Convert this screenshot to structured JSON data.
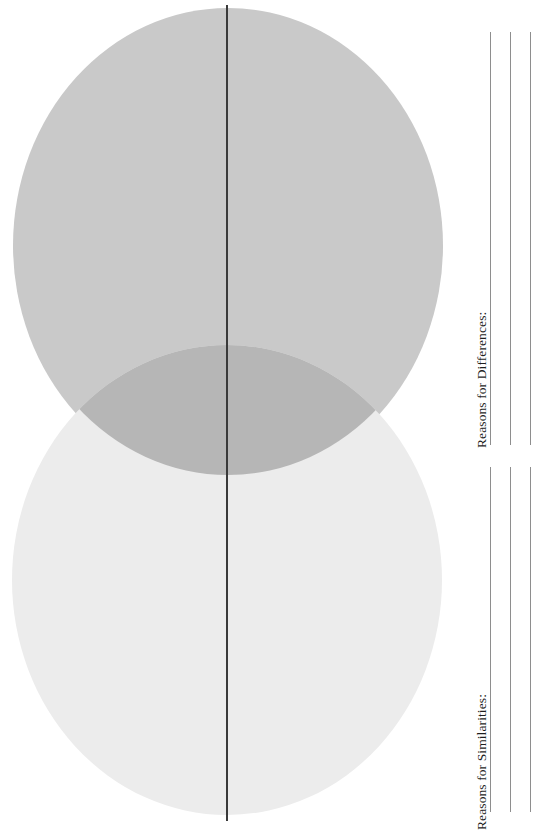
{
  "worksheet": {
    "title": "Venn Diagram Comparison Worksheet",
    "orientation": "landscape-rotated",
    "background_color": "#ffffff"
  },
  "venn": {
    "name": "two-circle-venn-diagram",
    "divider": {
      "name": "center-divider-line",
      "color": "#3a3a3a",
      "orientation": "vertical"
    },
    "circles": [
      {
        "id": "circle-top",
        "label": "",
        "fill_color": "#c9c9c9",
        "position": "upper"
      },
      {
        "id": "circle-bottom",
        "label": "",
        "fill_color": "#ececec",
        "position": "lower"
      }
    ],
    "overlap": {
      "id": "circle-overlap",
      "label": "",
      "fill_color": "#b6b6b6"
    }
  },
  "sections": [
    {
      "id": "differences",
      "label": "Reasons for Differences:",
      "line_count": 3,
      "line_color": "#8e8e8e"
    },
    {
      "id": "similarities",
      "label": "Reasons for Similarities:",
      "line_count": 3,
      "line_color": "#8e8e8e"
    }
  ]
}
